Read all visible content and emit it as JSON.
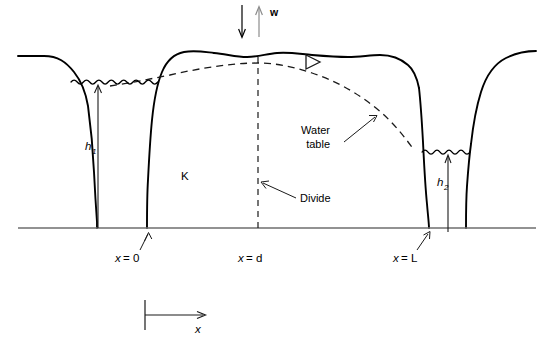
{
  "figure": {
    "domain": "diagram",
    "background_color": "#ffffff",
    "line_color": "#000000",
    "datum_color": "#6e6e6e",
    "recharge_arrow_color": "#8c8c8c"
  },
  "labels": {
    "recharge": "w",
    "hydraulic_conductivity": "K",
    "head_left": "h",
    "head_left_sub": "1",
    "head_right": "h",
    "head_right_sub": "2",
    "water_table_line1": "Water",
    "water_table_line2": "table",
    "divide": "Divide",
    "x_zero_var": "x",
    "x_zero_eq": "= 0",
    "x_divide_var": "x",
    "x_divide_eq": "= d",
    "x_length_var": "x",
    "x_length_eq": "= L",
    "axis_x": "x"
  },
  "annotations": {
    "x_zero_full": "x = 0",
    "x_divide_full": "x = d",
    "x_length_full": "x = L",
    "water_table_full": "Water table"
  },
  "icons": {
    "water_table_symbol": "water-table-triangle-icon",
    "recharge_down": "arrow-down-icon",
    "recharge_up": "arrow-up-icon",
    "axis_arrow": "arrow-right-icon"
  },
  "geometry": {
    "datum_y": 228,
    "stream_left_water_y": 82,
    "stream_right_water_y": 152,
    "divide_x": 258,
    "x_zero": 147,
    "x_length": 429,
    "crest_y": 52
  }
}
